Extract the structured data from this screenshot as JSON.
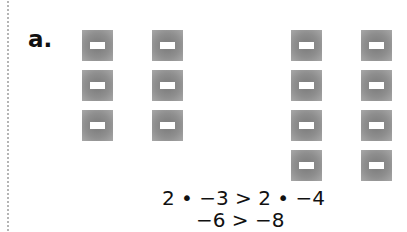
{
  "part_label": "a.",
  "tiles": {
    "symbol": "minus-tile-icon",
    "group_left": {
      "columns": 2,
      "rows": 3,
      "count": 6
    },
    "group_right": {
      "columns": 2,
      "rows": 4,
      "count": 8
    }
  },
  "equations": {
    "line1": "2 • −3 > 2 • −4",
    "line2": "−6 > −8"
  }
}
